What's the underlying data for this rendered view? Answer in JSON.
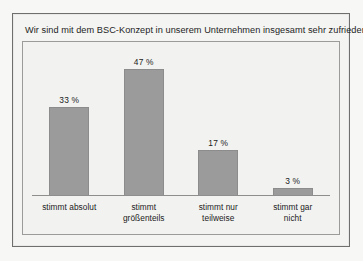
{
  "chart_data": {
    "type": "bar",
    "title": "Wir sind mit dem BSC-Konzept in unserem Unternehmen insgesamt sehr zufrieden",
    "xlabel": "",
    "ylabel": "",
    "ylim": [
      0,
      52
    ],
    "grid": false,
    "legend": "none",
    "categories": [
      "stimmt absolut",
      "stimmt größenteils",
      "stimmt nur teilweise",
      "stimmt gar nicht"
    ],
    "category_lines": [
      [
        "stimmt absolut"
      ],
      [
        "stimmt",
        "größenteils"
      ],
      [
        "stimmt nur",
        "teilweise"
      ],
      [
        "stimmt gar",
        "nicht"
      ]
    ],
    "values": [
      33,
      47,
      17,
      3
    ],
    "value_labels": [
      "33 %",
      "47 %",
      "17 %",
      "3 %"
    ],
    "bar_color": "#9b9b9b",
    "plot_background": "#f2f2f0",
    "frame_color": "#6f6f6f",
    "axis_color": "#8e8e8e",
    "text_color": "#1b1b1b"
  }
}
